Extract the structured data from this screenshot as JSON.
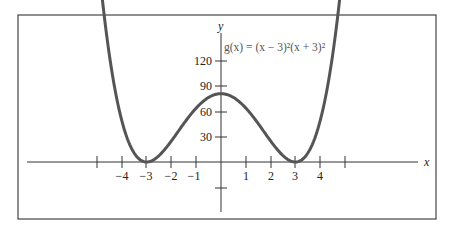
{
  "chart_data": {
    "type": "line",
    "title": "",
    "function_label": "g(x) = (x − 3)²(x + 3)²",
    "xlabel": "x",
    "ylabel": "y",
    "xlim": [
      -5.5,
      5.5
    ],
    "ylim": [
      -40,
      150
    ],
    "x_ticks": [
      -5,
      -4,
      -3,
      -2,
      -1,
      1,
      2,
      3,
      4,
      5
    ],
    "x_tick_labels": [
      "-4",
      "-3",
      "-2",
      "-1",
      "1",
      "2",
      "3",
      "4"
    ],
    "y_ticks": [
      -30,
      30,
      60,
      90,
      120
    ],
    "y_tick_labels": [
      "30",
      "60",
      "90",
      "120"
    ],
    "grid": false,
    "series": [
      {
        "name": "g(x)",
        "x": [
          -4.8,
          -4.5,
          -4,
          -3.5,
          -3,
          -2.5,
          -2,
          -1.5,
          -1,
          -0.5,
          0,
          0.5,
          1,
          1.5,
          2,
          2.5,
          3,
          3.5,
          4,
          4.5,
          4.8
        ],
        "values": [
          142.9,
          101.3,
          49,
          15.0,
          0,
          8.3,
          25,
          45.6,
          64,
          76.6,
          81,
          76.6,
          64,
          45.6,
          25,
          8.3,
          0,
          15.0,
          49,
          101.3,
          142.9
        ]
      }
    ]
  },
  "labels": {
    "x_axis": "x",
    "y_axis": "y",
    "function": "g(x) = (x − 3)²(x + 3)²",
    "xt": [
      "−4",
      "−3",
      "−2",
      "−1",
      "1",
      "2",
      "3",
      "4"
    ],
    "yt": [
      "30",
      "60",
      "90",
      "120"
    ]
  }
}
